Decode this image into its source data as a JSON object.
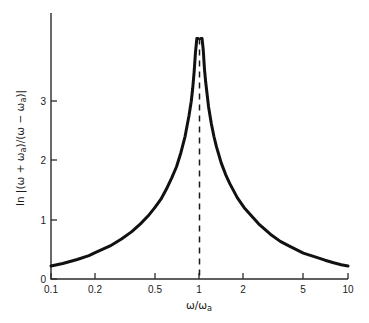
{
  "figure": {
    "background_color": "#ffffff",
    "line_color": "#111111"
  },
  "axes": {
    "x_title": "ω/ωa",
    "y_title": "ln |(ω + ωa)/(ω − ωa)|",
    "x_ticks": [
      "0.1",
      "0.2",
      "0.5",
      "1",
      "2",
      "5",
      "10"
    ],
    "y_ticks": [
      "0",
      "1",
      "2",
      "3"
    ]
  },
  "chart_data": {
    "type": "line",
    "title": "",
    "subtitle": "",
    "xlabel": "ω/ωa",
    "ylabel": "ln |(ω + ωa)/(ω − ωa)|",
    "xscale": "log",
    "yscale": "linear",
    "xlim": [
      0.1,
      10
    ],
    "ylim": [
      0,
      4
    ],
    "xticks": [
      0.1,
      0.2,
      0.5,
      1,
      2,
      5,
      10
    ],
    "xticklabels": [
      "0.1",
      "0.2",
      "0.5",
      "1",
      "2",
      "5",
      "10"
    ],
    "yticks": [
      0,
      1,
      2,
      3
    ],
    "yticklabels": [
      "0",
      "1",
      "2",
      "3"
    ],
    "grid": false,
    "legend": false,
    "legend_position": "none",
    "annotations": [
      {
        "kind": "vertical-dashed-asymptote",
        "x": 1,
        "label": "singularity at ω = ωa"
      }
    ],
    "series": [
      {
        "name": "ln |(ω + ωa)/(ω − ωa)|",
        "color": "#111111",
        "linewidth": 3,
        "linestyle": "solid",
        "x": [
          0.1,
          0.12,
          0.15,
          0.18,
          0.2,
          0.25,
          0.3,
          0.35,
          0.4,
          0.45,
          0.5,
          0.55,
          0.6,
          0.65,
          0.7,
          0.75,
          0.8,
          0.85,
          0.88,
          0.9,
          0.92,
          0.94,
          0.96,
          0.97,
          0.975,
          0.98,
          1.0,
          1.02,
          1.025,
          1.03,
          1.04,
          1.06,
          1.08,
          1.1,
          1.15,
          1.2,
          1.25,
          1.3,
          1.4,
          1.5,
          1.6,
          1.8,
          2.0,
          2.5,
          3.0,
          3.5,
          4.0,
          5.0,
          6.0,
          7.0,
          8.0,
          9.0,
          10.0
        ],
        "y": [
          0.2,
          0.24,
          0.3,
          0.36,
          0.41,
          0.51,
          0.62,
          0.73,
          0.85,
          0.97,
          1.1,
          1.23,
          1.39,
          1.56,
          1.73,
          1.95,
          2.2,
          2.52,
          2.74,
          2.94,
          3.19,
          3.5,
          3.91,
          4.19,
          4.36,
          4.6,
          9.9,
          4.6,
          4.38,
          4.2,
          3.93,
          3.53,
          3.24,
          3.04,
          2.66,
          2.4,
          2.2,
          2.04,
          1.79,
          1.61,
          1.47,
          1.25,
          1.1,
          0.85,
          0.69,
          0.58,
          0.51,
          0.4,
          0.34,
          0.29,
          0.25,
          0.22,
          0.2
        ],
        "note": "y = ln|(x+1)/(x-1)|; rendered clipped at the top of the axes"
      }
    ]
  }
}
